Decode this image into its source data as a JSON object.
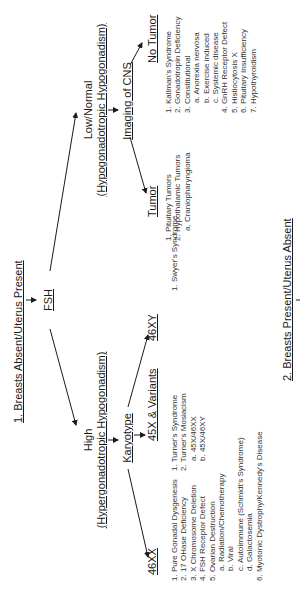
{
  "orientation": "rotated-90-ccw",
  "branch1": {
    "title": "1.  Breasts Absent/Uterus Present",
    "test": "FSH",
    "low": {
      "label": "Low/Normal",
      "sublabel": "(Hypogonadotropic Hypogonadism)",
      "next": "Imaging of CNS",
      "tumor": {
        "label": "Tumor",
        "items": [
          "1.  Pituitary Tumors",
          "2.  Hypothalamic Tumors",
          "a. Craniopharyngioma"
        ]
      },
      "no_tumor": {
        "label": "No Tumor",
        "items": [
          "1. Kallman's Syndrome",
          "2. Gonadotropin Deficiency",
          "3. Constitutional",
          "a. Anorexia nervosa",
          "b. Exercise induced",
          "c. Systemic disease",
          "4. GnRH Receptor Defect",
          "5. Histiocytosis X",
          "6. Pituitary Insufficiency",
          "7. Hypothyroidism"
        ]
      }
    },
    "high": {
      "label": "High",
      "sublabel": "(Hypergonadotropic Hypogonadism)",
      "next": "Karyotype",
      "k46xx": {
        "label": "46XX",
        "items": [
          "1. Pure Gonadal Dysgenesis",
          "2. 17 OHase Deficiency",
          "3. X Chromosome Deletion",
          "4. FSH Receptor Defect",
          "5. Ovarian Destruction",
          "a. Radiation/Chemotherapy",
          "b. Viral",
          "c. Autoimmune (Schmidt's Syndrome)",
          "d. Galactosemia",
          "6. Myotonic Dystrophy/Kennedy's Disease"
        ]
      },
      "k45x": {
        "label": "45X & Variants",
        "items": [
          "1. Turner's Syndrome",
          "2. Turner's Mosiacism",
          "a. 45X/46XX",
          "b. 45X/46XY"
        ]
      },
      "k46xy": {
        "label": "46XY",
        "items": [
          "1. Swyer's Syndrome"
        ]
      }
    }
  },
  "branch2": {
    "title": "2. Breasts Present/Uterus Absent"
  },
  "colors": {
    "text": "#1a1a1a",
    "background": "#ffffff"
  }
}
